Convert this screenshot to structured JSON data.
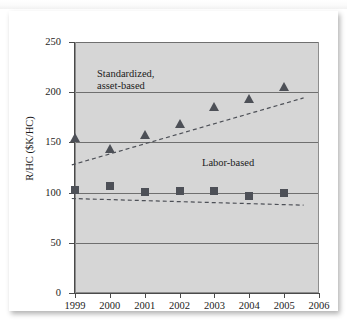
{
  "figure": {
    "y_axis_title": "R/HC ($K/HC)",
    "annotations": {
      "asset_based_line1": "Standardized,",
      "asset_based_line2": "asset-based",
      "labor_based": "Labor-based"
    },
    "colors": {
      "plot_background": "#d6d6d6",
      "marker": "#4d5057",
      "gridline": "#6f6f6f",
      "axis": "#4a4a4a",
      "text": "#1c1c1c"
    }
  },
  "chart_data": {
    "type": "scatter",
    "title": "",
    "xlabel": "",
    "ylabel": "R/HC ($K/HC)",
    "x": [
      1999,
      2000,
      2001,
      2002,
      2003,
      2004,
      2005
    ],
    "xticklabels": [
      "1999",
      "2000",
      "2001",
      "2002",
      "2003",
      "2004",
      "2005",
      "2006"
    ],
    "xlim": [
      1999,
      2006
    ],
    "ylim": [
      0,
      250
    ],
    "yticks": [
      0,
      50,
      100,
      150,
      200,
      250
    ],
    "yticklabels": [
      "0",
      "50",
      "100",
      "150",
      "200",
      "250"
    ],
    "grid": true,
    "grid_axis": "y",
    "legend": "inline-annotations",
    "series": [
      {
        "name": "Standardized, asset-based",
        "marker": "triangle",
        "trendline": "dashed",
        "values": [
          154,
          143,
          157,
          168,
          185,
          193,
          205
        ]
      },
      {
        "name": "Labor-based",
        "marker": "square",
        "trendline": "dashed",
        "values": [
          103,
          107,
          101,
          102,
          102,
          97,
          100
        ]
      }
    ]
  }
}
